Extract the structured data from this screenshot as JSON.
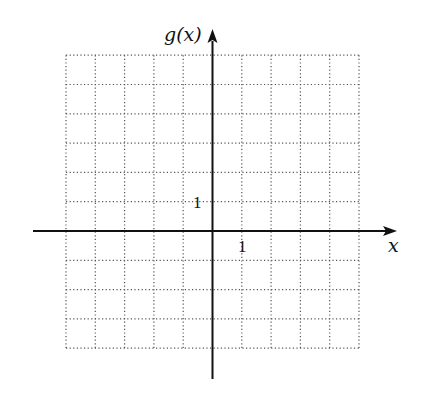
{
  "chart_data": {
    "type": "line",
    "title": "",
    "xlabel": "x",
    "ylabel": "g(x)",
    "xlim": [
      -5,
      5
    ],
    "ylim": [
      -4,
      6
    ],
    "grid": true,
    "grid_style": "dotted",
    "grid_step": 1,
    "tick_labels": {
      "x": [
        {
          "value": 1,
          "label": "1"
        }
      ],
      "y": [
        {
          "value": 1,
          "label": "1"
        }
      ]
    },
    "series": [],
    "legend": null
  },
  "labels": {
    "x_axis": "x",
    "y_axis": "g(x)",
    "x_tick": "1",
    "y_tick": "1"
  },
  "colors": {
    "axis": "#111111",
    "grid": "#555555",
    "background": "#ffffff"
  }
}
